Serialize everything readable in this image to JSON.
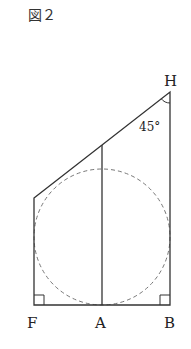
{
  "figure": {
    "title": "図２",
    "points": {
      "H": {
        "label": "H",
        "x": 170,
        "y": 92
      },
      "F": {
        "label": "F",
        "x": 34,
        "y": 305
      },
      "A": {
        "label": "A",
        "x": 102,
        "y": 305
      },
      "B": {
        "label": "B",
        "x": 170,
        "y": 305
      },
      "C": {
        "label": "",
        "x": 34,
        "y": 198
      }
    },
    "angle_label": "45°",
    "circle": {
      "cx": 102,
      "cy": 237,
      "r": 68,
      "style": "dashed"
    },
    "colors": {
      "line": "#333333",
      "dash": "#666666",
      "text": "#222222"
    }
  }
}
